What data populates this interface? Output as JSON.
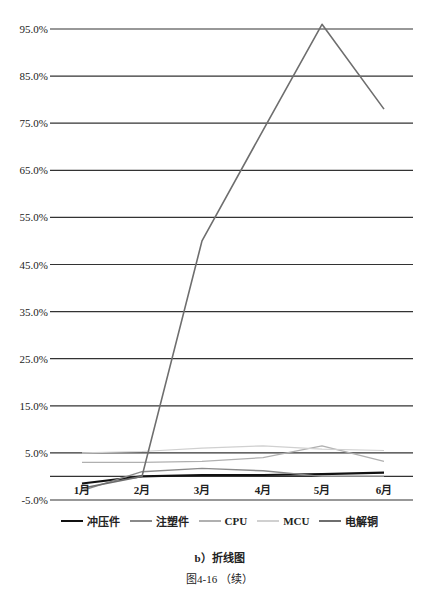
{
  "chart_data": {
    "type": "line",
    "title": "",
    "xlabel": "",
    "ylabel": "",
    "categories": [
      "1月",
      "2月",
      "3月",
      "4月",
      "5月",
      "6月"
    ],
    "y_ticks": [
      "95.0%",
      "85.0%",
      "75.0%",
      "65.0%",
      "55.0%",
      "45.0%",
      "35.0%",
      "25.0%",
      "15.0%",
      "5.0%",
      "-5.0%"
    ],
    "ylim": [
      -5,
      95
    ],
    "grid": true,
    "legend_position": "bottom",
    "series": [
      {
        "name": "冲压件",
        "color": "#111111",
        "width": 2.2,
        "values": [
          -1.5,
          0.0,
          0.3,
          0.3,
          0.5,
          0.8
        ]
      },
      {
        "name": "注塑件",
        "color": "#8a8a8a",
        "width": 1.4,
        "values": [
          -3.0,
          1.0,
          1.7,
          1.2,
          0.0,
          0.0
        ]
      },
      {
        "name": "CPU",
        "color": "#b0b0b0",
        "width": 1.2,
        "values": [
          3.0,
          3.0,
          3.2,
          4.0,
          6.5,
          3.2
        ]
      },
      {
        "name": "MCU",
        "color": "#d0d0d0",
        "width": 1.2,
        "values": [
          5.0,
          5.3,
          6.0,
          6.5,
          5.8,
          5.5
        ]
      },
      {
        "name": "电解铜",
        "color": "#6e6e6e",
        "width": 1.6,
        "values": [
          -2.5,
          0.0,
          50.0,
          73.5,
          96.0,
          78.0
        ]
      }
    ]
  },
  "legend": {
    "items": [
      {
        "label": "冲压件",
        "color": "#111111"
      },
      {
        "label": "注塑件",
        "color": "#8a8a8a"
      },
      {
        "label": "CPU",
        "color": "#b0b0b0"
      },
      {
        "label": "MCU",
        "color": "#d0d0d0"
      },
      {
        "label": "电解铜",
        "color": "#6e6e6e"
      }
    ]
  },
  "captions": {
    "subcaption": "b）折线图",
    "figure": "图4-16  （续）"
  }
}
